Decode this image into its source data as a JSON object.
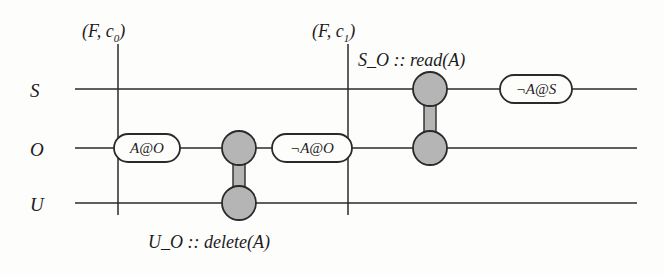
{
  "figure": {
    "background_color": "#fdfdfc",
    "line_color": "#2a2a2a",
    "node_fill_color": "#b5b5b5",
    "node_stroke_color": "#2a2a2a",
    "bar_fill_color": "#b5b5b5"
  },
  "lanes": [
    {
      "id": "S",
      "label": "S",
      "y": 89
    },
    {
      "id": "O",
      "label": "O",
      "y": 148
    },
    {
      "id": "U",
      "label": "U",
      "y": 203
    }
  ],
  "timelines": {
    "x_start": 75,
    "x_end": 637
  },
  "cut_markers": [
    {
      "id": "c0",
      "label": "(F, c",
      "sub": "0",
      "label_end": ")",
      "x": 118,
      "y_top": 44,
      "y_bottom": 215
    },
    {
      "id": "c1",
      "label": "(F, c",
      "sub": "1",
      "label_end": ")",
      "x": 348,
      "y_top": 44,
      "y_bottom": 215
    }
  ],
  "state_boxes": [
    {
      "id": "a-at-o",
      "text": "A@O",
      "lane": "O",
      "cx": 147,
      "cy": 148,
      "width": 66,
      "height": 28
    },
    {
      "id": "not-a-at-o",
      "text": "¬A@O",
      "lane": "O",
      "cx": 312,
      "cy": 148,
      "width": 80,
      "height": 28
    },
    {
      "id": "not-a-at-s",
      "text": "¬A@S",
      "lane": "S",
      "cx": 536,
      "cy": 89,
      "width": 72,
      "height": 28
    }
  ],
  "interactions": [
    {
      "id": "u-o-delete",
      "label": "U_O :: delete(A)",
      "label_x": 148,
      "label_y": 233,
      "x": 239,
      "from_lane": "O",
      "to_lane": "U",
      "from_y": 148,
      "to_y": 203,
      "node_radius": 17
    },
    {
      "id": "s-o-read",
      "label": "S_O :: read(A)",
      "label_x": 358,
      "label_y": 51,
      "x": 430,
      "from_lane": "S",
      "to_lane": "O",
      "from_y": 89,
      "to_y": 148,
      "node_radius": 17
    }
  ]
}
